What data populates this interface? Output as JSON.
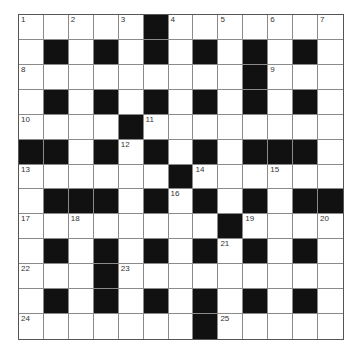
{
  "puzzle": {
    "type": "crossword",
    "rows": 13,
    "cols": 13,
    "colors": {
      "block": "#111111",
      "cell": "#ffffff",
      "grid_line": "#8a8a8a",
      "number_text": "#333333"
    },
    "layout": [
      "WWWWWBWWWWWWW",
      "WBWBWBWBWBWBW",
      "WWWWWWWWWBWWW",
      "WBWBWBWBWBWBW",
      "WWWWBWWWWWWWW",
      "BBWBWBWBWBBBW",
      "WWWWWWBWWWWWW",
      "WBBBWBWBWBWBB",
      "WWWWWWWWBWWWW",
      "WBWBWBWBWBWBW",
      "WWWBWWWWWWWWW",
      "WBWBWBWBWBWBW",
      "WWWWWWWBWWWWW"
    ],
    "numbers": [
      {
        "n": "1",
        "row": 0,
        "col": 0
      },
      {
        "n": "2",
        "row": 0,
        "col": 2
      },
      {
        "n": "3",
        "row": 0,
        "col": 4
      },
      {
        "n": "4",
        "row": 0,
        "col": 6
      },
      {
        "n": "5",
        "row": 0,
        "col": 8
      },
      {
        "n": "6",
        "row": 0,
        "col": 10
      },
      {
        "n": "7",
        "row": 0,
        "col": 12
      },
      {
        "n": "8",
        "row": 2,
        "col": 0
      },
      {
        "n": "9",
        "row": 2,
        "col": 10
      },
      {
        "n": "10",
        "row": 4,
        "col": 0
      },
      {
        "n": "11",
        "row": 4,
        "col": 5
      },
      {
        "n": "12",
        "row": 5,
        "col": 4
      },
      {
        "n": "13",
        "row": 6,
        "col": 0
      },
      {
        "n": "14",
        "row": 6,
        "col": 7
      },
      {
        "n": "15",
        "row": 6,
        "col": 10
      },
      {
        "n": "16",
        "row": 7,
        "col": 6
      },
      {
        "n": "17",
        "row": 8,
        "col": 0
      },
      {
        "n": "18",
        "row": 8,
        "col": 2
      },
      {
        "n": "19",
        "row": 8,
        "col": 9
      },
      {
        "n": "20",
        "row": 8,
        "col": 12
      },
      {
        "n": "21",
        "row": 9,
        "col": 8
      },
      {
        "n": "22",
        "row": 10,
        "col": 0
      },
      {
        "n": "23",
        "row": 10,
        "col": 4
      },
      {
        "n": "24",
        "row": 12,
        "col": 0
      },
      {
        "n": "25",
        "row": 12,
        "col": 8
      }
    ]
  }
}
